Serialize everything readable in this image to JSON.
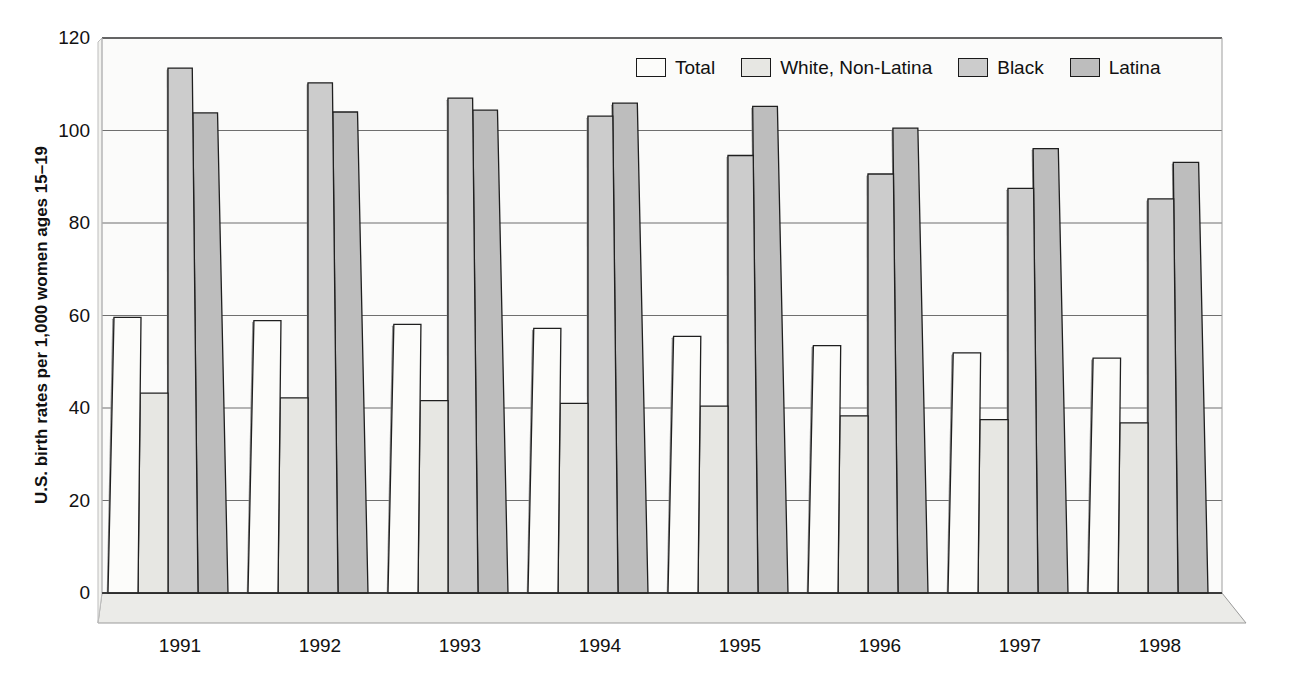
{
  "chart_data": {
    "type": "bar",
    "title": "",
    "xlabel": "",
    "ylabel": "U.S. birth rates per 1,000 women ages 15–19",
    "ylim": [
      0,
      120
    ],
    "yticks": [
      0,
      20,
      40,
      60,
      80,
      100,
      120
    ],
    "ytick_labels": [
      "0",
      "20",
      "40",
      "60",
      "80",
      "100",
      "120"
    ],
    "grid": true,
    "legend_position": "top-right",
    "style": "3d-perspective-grouped-bars",
    "categories": [
      "1991",
      "1992",
      "1993",
      "1994",
      "1995",
      "1996",
      "1997",
      "1998"
    ],
    "series": [
      {
        "name": "Total",
        "values": [
          59.6,
          58.9,
          58.1,
          57.2,
          55.5,
          53.5,
          51.9,
          50.8
        ],
        "color": "#fcfcfa"
      },
      {
        "name": "White, Non-Latina",
        "values": [
          43.2,
          42.2,
          41.6,
          41.0,
          40.4,
          38.3,
          37.5,
          36.8
        ],
        "color": "#e7e7e3"
      },
      {
        "name": "Black",
        "values": [
          113.5,
          110.3,
          107.0,
          103.1,
          94.6,
          90.6,
          87.5,
          85.2
        ],
        "color": "#cccccc"
      },
      {
        "name": "Latina",
        "values": [
          103.8,
          104.0,
          104.4,
          105.9,
          105.2,
          100.5,
          96.1,
          93.1
        ],
        "color": "#bdbdbd"
      }
    ]
  },
  "legend": {
    "items": [
      {
        "label": "Total"
      },
      {
        "label": "White, Non-Latina"
      },
      {
        "label": "Black"
      },
      {
        "label": "Latina"
      }
    ]
  }
}
